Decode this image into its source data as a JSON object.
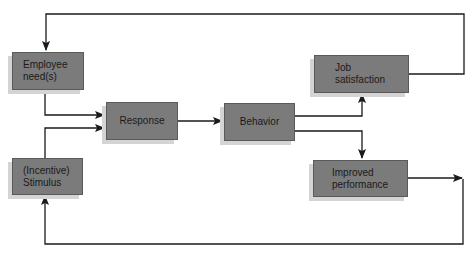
{
  "diagram": {
    "nodes": {
      "employee_needs": {
        "label": "Employee\nneed(s)"
      },
      "stimulus": {
        "label": "(Incentive)\nStimulus"
      },
      "response": {
        "label": "Response"
      },
      "behavior": {
        "label": "Behavior"
      },
      "job_satisfaction": {
        "label": "Job\nsatisfaction"
      },
      "improved_performance": {
        "label": "Improved\nperformance"
      }
    },
    "edges": [
      {
        "from": "employee_needs",
        "to": "response"
      },
      {
        "from": "stimulus",
        "to": "response"
      },
      {
        "from": "response",
        "to": "behavior"
      },
      {
        "from": "behavior",
        "to": "job_satisfaction"
      },
      {
        "from": "behavior",
        "to": "improved_performance"
      },
      {
        "from": "job_satisfaction",
        "to": "employee_needs",
        "type": "feedback-loop-top"
      },
      {
        "from": "improved_performance",
        "to": "stimulus",
        "type": "feedback-loop-bottom"
      }
    ],
    "colors": {
      "box_fill": "#7b7b7b",
      "box_shadow": "#d4d4d4",
      "line": "#1a1a1a"
    }
  }
}
